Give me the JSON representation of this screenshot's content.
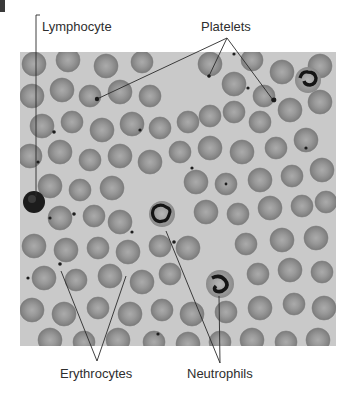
{
  "figure": {
    "labels": {
      "lymphocyte": "Lymphocyte",
      "platelets": "Platelets",
      "erythrocytes": "Erythrocytes",
      "neutrophils": "Neutrophils"
    },
    "colors": {
      "background": "#ffffff",
      "plasma": "#c9c9c9",
      "erythrocyte": "#8f8f8f",
      "erythrocyte_center": "#a9a9a9",
      "nucleus": "#1e1e1e",
      "leader_line": "#2a2a2a",
      "text": "#2e2e2e"
    }
  }
}
